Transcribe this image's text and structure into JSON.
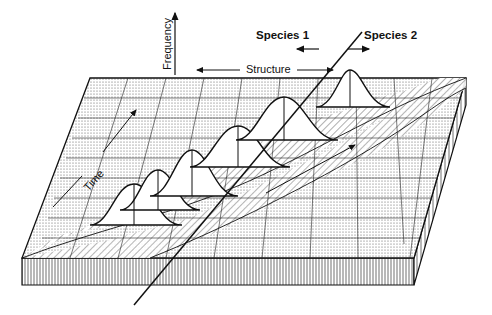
{
  "diagram": {
    "type": "3d-landscape",
    "labels": {
      "frequency_axis": "Frequency",
      "structure_axis": "Structure",
      "time_axis": "Time",
      "species_1": "Species 1",
      "species_2": "Species 2"
    },
    "curves": {
      "count": 6,
      "shape": "gaussian"
    },
    "colors": {
      "line": "#111111",
      "background": "#ffffff",
      "stipple": "#555555",
      "hatch": "#333333"
    }
  }
}
